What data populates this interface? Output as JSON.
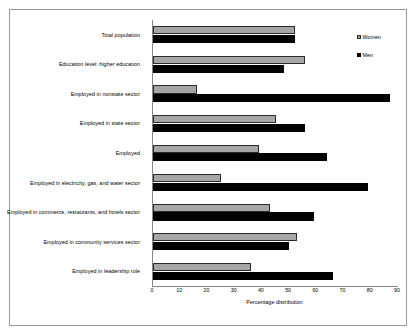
{
  "chart_data": {
    "type": "bar",
    "orientation": "horizontal",
    "title": "",
    "subtitle": "",
    "xlabel": "Percentage distribution",
    "ylabel": "",
    "xlim": [
      0,
      90
    ],
    "xticks": [
      0,
      10,
      20,
      30,
      40,
      50,
      60,
      70,
      80,
      90
    ],
    "xtick_labels": [
      "0",
      "10",
      "20",
      "30",
      "40",
      "50",
      "60",
      "70",
      "80",
      "90"
    ],
    "grid": false,
    "legend_position": "right",
    "categories": [
      "Total population",
      "Education level: higher education",
      "Employed in nonstate sector",
      "Employed in state sector",
      "Employed",
      "Employed in electricity, gas, and water sector",
      "Employed in commerce, restaurants, and hotels sector",
      "Employed in community services sector",
      "Employed in leadership role"
    ],
    "series": [
      {
        "name": "Women",
        "color": "#a6a6a6",
        "values": [
          52,
          56,
          16,
          45,
          39,
          25,
          43,
          53,
          36
        ]
      },
      {
        "name": "Men",
        "color": "#000000",
        "values": [
          52,
          48,
          87,
          56,
          64,
          79,
          59,
          50,
          66
        ]
      }
    ]
  },
  "legend": {
    "items": [
      {
        "label": "Women",
        "swatch": "gray-square-swatch"
      },
      {
        "label": "Men",
        "swatch": "black-square-swatch"
      }
    ]
  }
}
